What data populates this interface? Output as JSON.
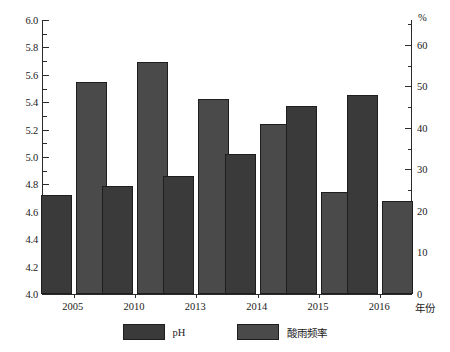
{
  "chart_data": {
    "type": "bar",
    "title": "",
    "subtitle": "",
    "xlabel": "年份",
    "ylabel": "",
    "categories": [
      "2005",
      "2010",
      "2013",
      "2014",
      "2015",
      "2016"
    ],
    "series": [
      {
        "name": "pH",
        "axis": "left",
        "color": "#3a3a3a",
        "values": [
          4.72,
          4.79,
          4.86,
          5.02,
          5.37,
          5.45
        ]
      },
      {
        "name": "酸雨频率",
        "axis": "right",
        "unit": "%",
        "color": "#4a4a4a",
        "values": [
          51,
          56,
          47,
          41,
          24.5,
          22.5
        ]
      }
    ],
    "left_axis": {
      "label": "",
      "ylim": [
        4.0,
        6.0
      ],
      "major_step": 0.2,
      "minor_step": 0.1,
      "ticks": [
        "4.0",
        "4.2",
        "4.4",
        "4.6",
        "4.8",
        "5.0",
        "5.2",
        "5.4",
        "5.6",
        "5.8",
        "6.0"
      ]
    },
    "right_axis": {
      "label": "%",
      "ylim": [
        0,
        66
      ],
      "major_step": 10,
      "minor_step": 5,
      "ticks": [
        "0",
        "10",
        "20",
        "30",
        "40",
        "50",
        "60"
      ]
    },
    "grid": false,
    "legend": {
      "position": "bottom",
      "entries": [
        "pH",
        "酸雨频率"
      ]
    }
  },
  "axis_unit_top_right": "%",
  "axis_unit_bottom_right": "年份"
}
